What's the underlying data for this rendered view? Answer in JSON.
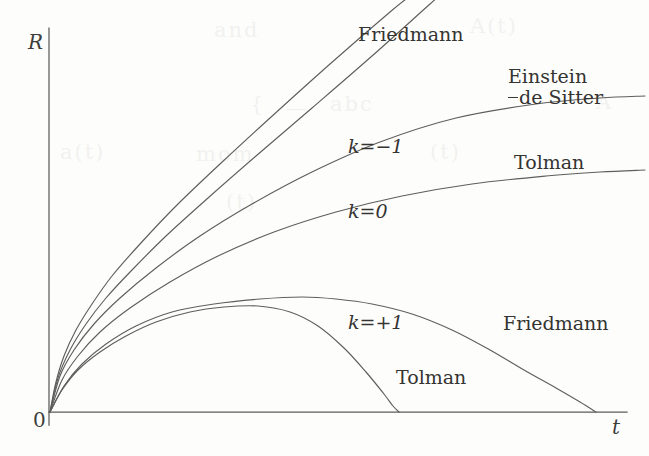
{
  "figure": {
    "background_color": "#fdfdfb",
    "ink_color": "#5e5e5c"
  },
  "axes": {
    "y_label": "R",
    "x_label": "t",
    "origin_label": "0",
    "x_axis_pixels": {
      "y": 412,
      "x_start": 49,
      "x_end": 627
    },
    "y_axis_pixels": {
      "x": 49,
      "y_start": 28,
      "y_end": 425
    },
    "ticks": [],
    "grid": false
  },
  "labels": {
    "friedmann_open": "Friedmann",
    "einstein_de_sitter_line1": "Einstein",
    "einstein_de_sitter_line2": "de Sitter",
    "tolman_flat": "Tolman",
    "k_minus_one": "k=−1",
    "k_zero": "k=0",
    "k_plus_one": "k=+1",
    "friedmann_closed": "Friedmann",
    "tolman_closed": "Tolman"
  },
  "ghost_text": [
    {
      "text": "and",
      "x": 214,
      "y": 18
    },
    {
      "text": "A(t)",
      "x": 470,
      "y": 14
    },
    {
      "text": "{",
      "x": 250,
      "y": 92
    },
    {
      "text": "—",
      "x": 286,
      "y": 96
    },
    {
      "text": "abc",
      "x": 330,
      "y": 92
    },
    {
      "text": "A",
      "x": 596,
      "y": 90
    },
    {
      "text": "a(t)",
      "x": 60,
      "y": 140
    },
    {
      "text": "mom",
      "x": 196,
      "y": 142
    },
    {
      "text": "(t)",
      "x": 430,
      "y": 140
    },
    {
      "text": "(t)",
      "x": 226,
      "y": 190
    }
  ],
  "chart_data": {
    "type": "line",
    "xlabel": "t",
    "ylabel": "R",
    "grid": false,
    "legend": "inline-annotations",
    "xlim": [
      0,
      1
    ],
    "ylim": [
      0,
      1
    ],
    "axis_pixels": {
      "origin": [
        49,
        412
      ],
      "x_end": [
        627,
        412
      ],
      "y_top": [
        49,
        28
      ]
    },
    "series": [
      {
        "name": "Friedmann k=-1",
        "label": "Friedmann",
        "k": -1,
        "curvature": "open",
        "points_px": [
          [
            50,
            412
          ],
          [
            56,
            382
          ],
          [
            64,
            356
          ],
          [
            76,
            330
          ],
          [
            92,
            304
          ],
          [
            112,
            276
          ],
          [
            140,
            244
          ],
          [
            176,
            206
          ],
          [
            220,
            164
          ],
          [
            270,
            118
          ],
          [
            330,
            64
          ],
          [
            390,
            12
          ],
          [
            410,
            -4
          ]
        ]
      },
      {
        "name": "Tolman k=-1",
        "label": "Friedmann",
        "k": -1,
        "curvature": "open",
        "points_px": [
          [
            50,
            412
          ],
          [
            58,
            378
          ],
          [
            70,
            350
          ],
          [
            86,
            324
          ],
          [
            106,
            298
          ],
          [
            132,
            270
          ],
          [
            166,
            236
          ],
          [
            208,
            198
          ],
          [
            256,
            156
          ],
          [
            312,
            108
          ],
          [
            372,
            56
          ],
          [
            430,
            4
          ],
          [
            446,
            -10
          ]
        ]
      },
      {
        "name": "Einstein-de Sitter k=0",
        "label": "Einstein de Sitter",
        "k": 0,
        "curvature": "flat",
        "points_px": [
          [
            50,
            412
          ],
          [
            60,
            376
          ],
          [
            74,
            350
          ],
          [
            94,
            324
          ],
          [
            120,
            298
          ],
          [
            156,
            268
          ],
          [
            200,
            236
          ],
          [
            252,
            204
          ],
          [
            312,
            172
          ],
          [
            380,
            142
          ],
          [
            456,
            118
          ],
          [
            536,
            104
          ],
          [
            600,
            98
          ],
          [
            645,
            96
          ]
        ]
      },
      {
        "name": "Tolman k=0",
        "label": "Tolman",
        "k": 0,
        "curvature": "flat",
        "points_px": [
          [
            50,
            412
          ],
          [
            62,
            380
          ],
          [
            78,
            356
          ],
          [
            100,
            332
          ],
          [
            130,
            308
          ],
          [
            170,
            282
          ],
          [
            218,
            256
          ],
          [
            274,
            232
          ],
          [
            336,
            212
          ],
          [
            402,
            196
          ],
          [
            472,
            184
          ],
          [
            546,
            176
          ],
          [
            600,
            172
          ],
          [
            645,
            170
          ]
        ]
      },
      {
        "name": "Friedmann k=+1",
        "label": "Friedmann",
        "k": 1,
        "curvature": "closed",
        "recollapse_px_x": 596,
        "peak_px": [
          336,
          299
        ],
        "points_px": [
          [
            50,
            412
          ],
          [
            64,
            386
          ],
          [
            82,
            364
          ],
          [
            106,
            344
          ],
          [
            136,
            326
          ],
          [
            172,
            312
          ],
          [
            214,
            304
          ],
          [
            260,
            299
          ],
          [
            302,
            297
          ],
          [
            336,
            299
          ],
          [
            372,
            304
          ],
          [
            412,
            314
          ],
          [
            452,
            330
          ],
          [
            490,
            350
          ],
          [
            524,
            370
          ],
          [
            556,
            388
          ],
          [
            580,
            402
          ],
          [
            596,
            412
          ]
        ]
      },
      {
        "name": "Tolman k=+1",
        "label": "Tolman",
        "k": 1,
        "curvature": "closed",
        "recollapse_px_x": 399,
        "peak_px": [
          258,
          306
        ],
        "points_px": [
          [
            50,
            412
          ],
          [
            62,
            390
          ],
          [
            78,
            370
          ],
          [
            100,
            352
          ],
          [
            126,
            336
          ],
          [
            156,
            322
          ],
          [
            190,
            312
          ],
          [
            224,
            307
          ],
          [
            258,
            306
          ],
          [
            290,
            312
          ],
          [
            318,
            326
          ],
          [
            344,
            348
          ],
          [
            366,
            372
          ],
          [
            384,
            394
          ],
          [
            393,
            406
          ],
          [
            399,
            412
          ]
        ]
      }
    ],
    "annotations": [
      {
        "text": "Friedmann",
        "x_px": 358,
        "y_px": 28,
        "attached_to": "Friedmann k=-1"
      },
      {
        "text": "Einstein",
        "x_px": 508,
        "y_px": 70,
        "attached_to": "Einstein-de Sitter k=0"
      },
      {
        "text": "de Sitter",
        "x_px": 508,
        "y_px": 89,
        "attached_to": "Einstein-de Sitter k=0"
      },
      {
        "text": "Tolman",
        "x_px": 514,
        "y_px": 156,
        "attached_to": "Tolman k=0"
      },
      {
        "text": "k=−1",
        "x_px": 348,
        "y_px": 139,
        "attached_to": "Friedmann k=-1"
      },
      {
        "text": "k=0",
        "x_px": 348,
        "y_px": 204,
        "attached_to": "Einstein-de Sitter k=0"
      },
      {
        "text": "k=+1",
        "x_px": 348,
        "y_px": 315,
        "attached_to": "Friedmann k=+1"
      },
      {
        "text": "Friedmann",
        "x_px": 503,
        "y_px": 317,
        "attached_to": "Friedmann k=+1"
      },
      {
        "text": "Tolman",
        "x_px": 396,
        "y_px": 371,
        "attached_to": "Tolman k=+1"
      }
    ]
  }
}
